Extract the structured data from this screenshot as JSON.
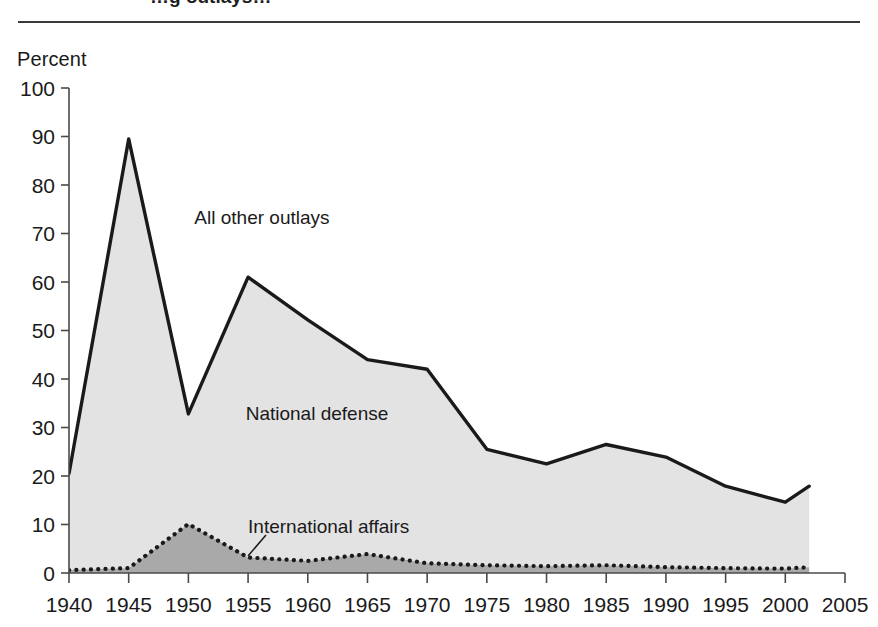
{
  "figure": {
    "title_partial": "…g outlays…",
    "y_axis_title": "Percent"
  },
  "chart_data": {
    "type": "area",
    "title": "",
    "xlabel": "",
    "ylabel": "Percent",
    "xlim": [
      1940,
      2005
    ],
    "ylim": [
      0,
      100
    ],
    "grid": false,
    "legend": "inline-annotations",
    "x": [
      1940,
      1945,
      1950,
      1955,
      1960,
      1965,
      1970,
      1975,
      1980,
      1985,
      1990,
      1995,
      2000,
      2002
    ],
    "xticks": [
      "1940",
      "1945",
      "1950",
      "1955",
      "1960",
      "1965",
      "1970",
      "1975",
      "1980",
      "1985",
      "1990",
      "1995",
      "2000",
      "2005"
    ],
    "yticks": [
      "0",
      "10",
      "20",
      "30",
      "40",
      "50",
      "60",
      "70",
      "80",
      "90",
      "100"
    ],
    "series": [
      {
        "name": "National defense",
        "style": "solid-line-filled-light-gray",
        "fill": "#e3e3e3",
        "line": "#1a1a1a",
        "values": [
          20.5,
          89.5,
          32.8,
          61.0,
          52.2,
          44.0,
          42.0,
          25.5,
          22.5,
          26.5,
          23.9,
          17.9,
          14.6,
          17.9
        ]
      },
      {
        "name": "International affairs",
        "style": "dotted-line-filled-dark-gray",
        "fill": "#a9a9a9",
        "line": "#1a1a1a",
        "values": [
          0.6,
          1.0,
          10.1,
          3.2,
          2.5,
          3.9,
          2.0,
          1.6,
          1.4,
          1.6,
          1.2,
          1.0,
          0.9,
          1.2
        ]
      }
    ],
    "annotations": [
      {
        "text": "All other outlays",
        "x": 1950.5,
        "y": 72
      },
      {
        "text": "National defense",
        "x": 1954.8,
        "y": 31.5
      },
      {
        "text": "International affairs",
        "x": 1955.0,
        "y": 8.2
      }
    ]
  }
}
